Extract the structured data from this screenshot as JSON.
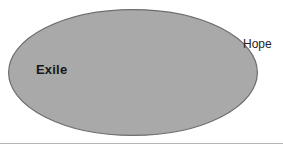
{
  "canvas": {
    "width": 283,
    "height": 150,
    "background": "#ffffff"
  },
  "diagram": {
    "type": "venn-single-set",
    "title": "",
    "shapes": [
      {
        "name": "exile-ellipse",
        "kind": "ellipse",
        "cx": 133,
        "cy": 72.5,
        "rx": 125,
        "ry": 63.5,
        "fill": "#a9a9a9",
        "stroke": "#6e6e6e",
        "stroke_width": 1.2
      }
    ],
    "rules": [
      {
        "name": "bottom-divider",
        "kind": "line",
        "x1": 0,
        "y1": 143.5,
        "x2": 283,
        "y2": 143.5,
        "stroke": "#b6b6b6",
        "stroke_width": 1
      }
    ]
  },
  "labels": {
    "exile": "Exile",
    "hope": "Hope"
  },
  "colors": {
    "ellipse_fill": "#a9a9a9",
    "ellipse_stroke": "#6e6e6e",
    "text": "#161616",
    "divider": "#b6b6b6",
    "background": "#ffffff"
  }
}
